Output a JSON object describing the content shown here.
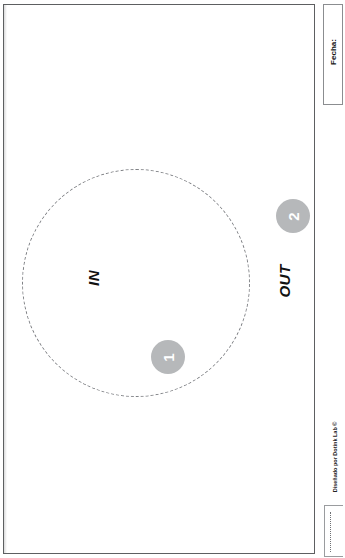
{
  "document": {
    "orientation": "landscape-rotated",
    "background_color": "#ffffff",
    "border_color": "#5d5f61"
  },
  "diagram": {
    "zone_label_in": "IN",
    "zone_label_out": "OUT",
    "circle_style": "dashed",
    "circle_color": "#7d7f83",
    "markers": [
      {
        "number": "1",
        "color": "#b6b8ba",
        "position": "inside-circle-bottom"
      },
      {
        "number": "2",
        "color": "#b6b8ba",
        "position": "outside-circle-right"
      }
    ]
  },
  "side_panel": {
    "date_field_label": "Fecha:",
    "credit": "Diseñado por Dotink Lab ©"
  }
}
